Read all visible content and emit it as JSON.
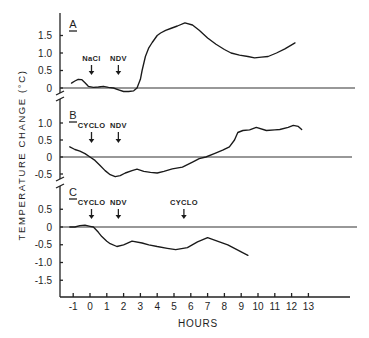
{
  "figure": {
    "ylabel": "TEMPERATURE CHANGE (°C)",
    "xlabel": "HOURS",
    "x_ticks": [
      "-1",
      "0",
      "1",
      "2",
      "3",
      "4",
      "5",
      "6",
      "7",
      "8",
      "9",
      "10",
      "11",
      "12",
      "13"
    ]
  },
  "chart_data": [
    {
      "type": "line",
      "panel": "A",
      "title": "A",
      "xlabel": "HOURS",
      "ylabel": "TEMPERATURE CHANGE (°C)",
      "y_ticks": [
        "1.5",
        "1.0",
        "0.5",
        "0"
      ],
      "y_tick_values": [
        1.5,
        1.0,
        0.5,
        0
      ],
      "xlim": [
        -1.8,
        15.5
      ],
      "grid": false,
      "annotations": [
        {
          "label": "NaCl",
          "x": 0
        },
        {
          "label": "NDV",
          "x": 1.6
        }
      ],
      "series": [
        {
          "name": "A",
          "x": [
            -1.1,
            -0.9,
            -0.7,
            -0.5,
            -0.3,
            -0.1,
            0.2,
            0.5,
            0.8,
            1.1,
            1.4,
            1.7,
            2.0,
            2.3,
            2.6,
            2.8,
            3.0,
            3.1,
            3.3,
            3.5,
            3.7,
            4.0,
            4.2,
            4.5,
            4.8,
            5.2,
            5.65,
            6.1,
            6.5,
            7.0,
            7.5,
            8.0,
            8.4,
            8.9,
            9.4,
            9.8,
            10.2,
            10.6,
            11.1,
            11.6,
            12.2
          ],
          "values": [
            0.14,
            0.2,
            0.25,
            0.24,
            0.15,
            0.05,
            0.02,
            0.03,
            0.05,
            0.02,
            0.0,
            -0.05,
            -0.1,
            -0.1,
            -0.08,
            0.0,
            0.25,
            0.5,
            0.9,
            1.15,
            1.3,
            1.5,
            1.57,
            1.65,
            1.7,
            1.77,
            1.86,
            1.8,
            1.65,
            1.43,
            1.25,
            1.1,
            1.0,
            0.94,
            0.9,
            0.86,
            0.88,
            0.9,
            1.0,
            1.12,
            1.29
          ]
        }
      ]
    },
    {
      "type": "line",
      "panel": "B",
      "title": "B",
      "xlabel": "HOURS",
      "ylabel": "TEMPERATURE CHANGE (°C)",
      "y_ticks": [
        "1.0",
        "0.5",
        "0",
        "-0.5"
      ],
      "y_tick_values": [
        1.0,
        0.5,
        0,
        -0.5
      ],
      "xlim": [
        -1.8,
        15.5
      ],
      "grid": false,
      "annotations": [
        {
          "label": "CYCLO",
          "x": 0
        },
        {
          "label": "NDV",
          "x": 1.6
        }
      ],
      "series": [
        {
          "name": "B",
          "x": [
            -1.2,
            -0.9,
            -0.6,
            -0.3,
            0.0,
            0.3,
            0.6,
            0.9,
            1.2,
            1.5,
            1.8,
            2.1,
            2.5,
            2.8,
            3.2,
            3.6,
            4.0,
            4.4,
            4.9,
            5.5,
            6.1,
            6.5,
            6.9,
            7.4,
            7.9,
            8.3,
            8.6,
            8.8,
            9.1,
            9.5,
            9.9,
            10.5,
            11.0,
            11.3,
            11.8,
            12.1,
            12.4,
            12.6
          ],
          "values": [
            0.3,
            0.22,
            0.17,
            0.1,
            0.0,
            -0.1,
            -0.25,
            -0.4,
            -0.52,
            -0.58,
            -0.55,
            -0.47,
            -0.4,
            -0.36,
            -0.42,
            -0.45,
            -0.47,
            -0.42,
            -0.35,
            -0.3,
            -0.15,
            -0.05,
            0.0,
            0.1,
            0.2,
            0.3,
            0.5,
            0.72,
            0.78,
            0.8,
            0.87,
            0.78,
            0.8,
            0.81,
            0.87,
            0.93,
            0.9,
            0.81
          ]
        }
      ]
    },
    {
      "type": "line",
      "panel": "C",
      "title": "C",
      "xlabel": "HOURS",
      "ylabel": "TEMPERATURE CHANGE (°C)",
      "y_ticks": [
        "0.5",
        "0",
        "-0.5",
        "-1.0",
        "-1.5"
      ],
      "y_tick_values": [
        0.5,
        0,
        -0.5,
        -1.0,
        -1.5
      ],
      "xlim": [
        -1.8,
        15.5
      ],
      "grid": false,
      "annotations": [
        {
          "label": "CYCLO",
          "x": 0
        },
        {
          "label": "NDV",
          "x": 1.6
        },
        {
          "label": "CYCLO",
          "x": 5.5
        }
      ],
      "series": [
        {
          "name": "C",
          "x": [
            -1.2,
            -0.9,
            -0.6,
            -0.3,
            0.0,
            0.2,
            0.5,
            0.7,
            1.0,
            1.2,
            1.6,
            2.0,
            2.5,
            3.1,
            3.5,
            4.0,
            4.6,
            5.1,
            5.8,
            6.4,
            7.0,
            7.7,
            8.2,
            8.6,
            9.0,
            9.4
          ],
          "values": [
            0.0,
            0.0,
            0.04,
            0.05,
            0.02,
            0.0,
            -0.15,
            -0.27,
            -0.4,
            -0.47,
            -0.55,
            -0.5,
            -0.4,
            -0.45,
            -0.5,
            -0.55,
            -0.6,
            -0.64,
            -0.58,
            -0.42,
            -0.3,
            -0.42,
            -0.5,
            -0.6,
            -0.7,
            -0.8
          ]
        }
      ]
    }
  ]
}
